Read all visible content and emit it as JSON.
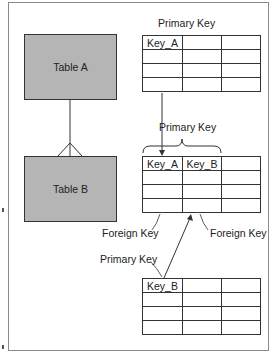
{
  "diagram": {
    "entities": [
      {
        "id": "table_a",
        "label": "Table A"
      },
      {
        "id": "table_b",
        "label": "Table B"
      }
    ],
    "relationship": {
      "from": "table_a",
      "to": "table_b",
      "type": "one-to-many"
    },
    "labels": {
      "primary_key_top": "Primary Key",
      "primary_key_middle": "Primary Key",
      "primary_key_bottom": "Primary Key",
      "foreign_key_left": "Foreign Key",
      "foreign_key_right": "Foreign Key"
    },
    "tables": {
      "top": {
        "headers": [
          "Key_A",
          "",
          ""
        ],
        "rows": 3
      },
      "middle": {
        "headers": [
          "Key_A",
          "Key_B",
          ""
        ],
        "rows": 3
      },
      "bottom": {
        "headers": [
          "Key_B",
          "",
          ""
        ],
        "rows": 3
      }
    }
  },
  "colors": {
    "entity_fill": "#b5b5b5",
    "key_column_fill": "#b5b5b5",
    "foreign_key_b_fill": "#a3a3a3",
    "line": "#333333"
  }
}
